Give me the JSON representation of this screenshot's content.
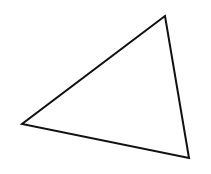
{
  "diagram": {
    "shape": "triangle",
    "vertices": [
      {
        "name": "top",
        "x": 165,
        "y": 16
      },
      {
        "name": "left",
        "x": 22,
        "y": 124
      },
      {
        "name": "bottom-right",
        "x": 189,
        "y": 158
      }
    ],
    "stroke_color": "#111111",
    "fill_color": "#ffffff",
    "stroke_width": 2
  }
}
